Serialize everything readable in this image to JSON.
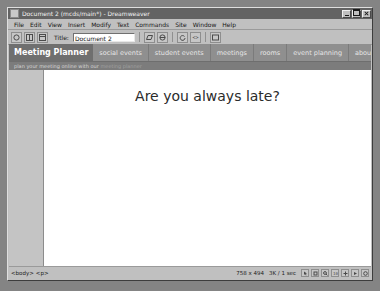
{
  "window": {
    "title": "Document 2 (mcds/main*) - Dreamweaver",
    "icon": "dreamweaver-icon",
    "controls": {
      "minimize": "minimize-button",
      "maximize": "maximize-button",
      "close": "close-button"
    }
  },
  "menu": {
    "items": [
      {
        "label": "File"
      },
      {
        "label": "Edit"
      },
      {
        "label": "View"
      },
      {
        "label": "Insert"
      },
      {
        "label": "Modify"
      },
      {
        "label": "Text"
      },
      {
        "label": "Commands"
      },
      {
        "label": "Site"
      },
      {
        "label": "Window"
      },
      {
        "label": "Help"
      }
    ]
  },
  "toolbar": {
    "view_buttons": [
      {
        "name": "code-view-button"
      },
      {
        "name": "split-view-button"
      },
      {
        "name": "design-view-button"
      }
    ],
    "title_label": "Title:",
    "title_value": "Document 2",
    "title_placeholder": "Untitled Document",
    "right_buttons": [
      {
        "name": "file-management-icon"
      },
      {
        "name": "preview-in-browser-icon"
      },
      {
        "name": "refresh-design-view-icon"
      },
      {
        "name": "view-options-icon"
      },
      {
        "name": "visual-aids-icon"
      }
    ]
  },
  "page": {
    "brand": "Meeting Planner",
    "nav": [
      {
        "label": "social events"
      },
      {
        "label": "student events"
      },
      {
        "label": "meetings"
      },
      {
        "label": "rooms"
      },
      {
        "label": "event planning"
      },
      {
        "label": "about us"
      }
    ],
    "tagline_lead": "plan your meeting online with our",
    "tagline_rest": "meeting planner",
    "headline": "Are you always late?"
  },
  "status": {
    "tags": [
      "<body>",
      "<p>"
    ],
    "window_size": "758 x 494",
    "download_size": "3K / 1 sec",
    "icons": [
      {
        "name": "select-tool-icon"
      },
      {
        "name": "hand-tool-icon"
      },
      {
        "name": "zoom-tool-icon"
      },
      {
        "name": "zoom-level-icon"
      },
      {
        "name": "guides-icon"
      },
      {
        "name": "ruler-icon"
      },
      {
        "name": "window-size-icon"
      }
    ]
  },
  "colors": {
    "titlebar": "#636363",
    "chrome": "#c0c0c0",
    "nav_bar": "#8f8f8f",
    "brand_block": "#6f6f6f",
    "tagline_bar": "#7c7c7c",
    "page_background": "#ffffff",
    "sidebar_column": "#c4c4c4",
    "headline_text": "#2b2b2b"
  }
}
